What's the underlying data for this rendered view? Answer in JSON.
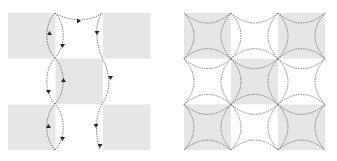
{
  "figure": {
    "panels": [
      {
        "id": "left",
        "description": "Checkerboard with dashed trajectories and direction arrows",
        "grid": {
          "rows": 3,
          "cols": 3,
          "x0": 8,
          "y0": 13,
          "cell_w": 47.5,
          "cell_h": 45.7
        },
        "shaded_cells": [
          [
            0,
            0
          ],
          [
            0,
            2
          ],
          [
            1,
            1
          ],
          [
            2,
            0
          ],
          [
            2,
            2
          ]
        ],
        "shade_color": "#e6e6e6",
        "trajectory_color": "#6a6a6a",
        "arrow_color": "#2a2a2a"
      },
      {
        "id": "right",
        "description": "Checkerboard overlaid with dashed circular arcs centered on grid vertices",
        "grid": {
          "rows": 3,
          "cols": 3,
          "x0": 184,
          "y0": 13,
          "cell_w": 47,
          "cell_h": 45.7
        },
        "shaded_cells": [
          [
            0,
            0
          ],
          [
            0,
            2
          ],
          [
            1,
            1
          ],
          [
            2,
            0
          ],
          [
            2,
            2
          ]
        ],
        "shade_color": "#e6e6e6",
        "arc_color": "#6a6a6a"
      }
    ]
  }
}
